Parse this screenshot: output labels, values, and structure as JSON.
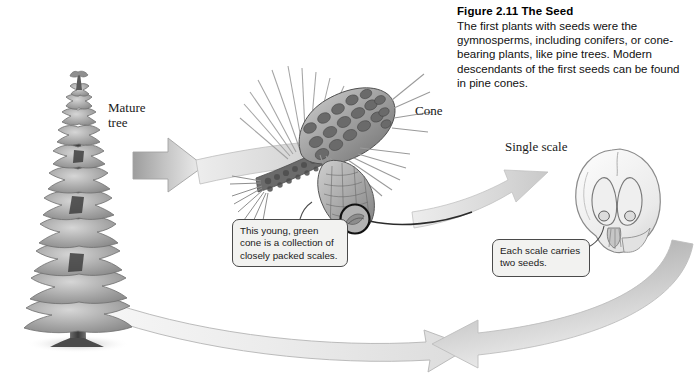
{
  "figure": {
    "caption_title": "Figure 2.11  The Seed",
    "caption_body": "The first plants with seeds were the gymnosperms, including conifers, or cone-bearing plants, like pine trees. Modern descendants of the first seeds can be found in pine cones.",
    "colors": {
      "arrow_fill_light": "#e8e8e8",
      "arrow_fill_mid": "#b9b9b9",
      "arrow_fill_dark": "#8f8f8f",
      "arrow_stroke": "#9a9a9a",
      "callout_bg": "#f2f2f0",
      "callout_border": "#4a4a4a",
      "ink": "#000000",
      "illustration_gray": "#7d7d7d"
    }
  },
  "labels": {
    "mature_tree": "Mature\ntree",
    "cone": "Cone",
    "single_scale": "Single scale"
  },
  "callouts": {
    "young_cone": "This young, green cone is a collection of closely packed scales.",
    "two_seeds": "Each scale carries two seeds."
  },
  "illustrations": {
    "mature_tree": "conifer-tree-illustration",
    "pine_branch": "pine-branch-with-cones-illustration",
    "single_scale": "seed-scale-cross-section-illustration",
    "detail_circle": "magnified-scale-detail-circle"
  },
  "flow_arrows": {
    "tree_to_cone": "arrow-right-tree-to-cone",
    "cone_to_scale": "arrow-right-cone-to-scale",
    "scale_to_bottom": "arrow-curve-down-right",
    "bottom_to_tree": "arrow-left-bottom-return"
  }
}
